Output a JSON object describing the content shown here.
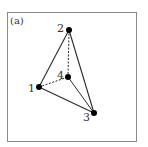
{
  "panel_label": "(a)",
  "colors": {
    "edge": "#2a2a2a",
    "frame": "#8a8a8a",
    "vertex": "#000000"
  },
  "vertices": [
    {
      "id": "1",
      "label": "1",
      "x": 39,
      "y": 87,
      "lx": 28,
      "ly": 92
    },
    {
      "id": "2",
      "label": "2",
      "x": 69,
      "y": 30,
      "lx": 57,
      "ly": 32
    },
    {
      "id": "3",
      "label": "3",
      "x": 94,
      "y": 113,
      "lx": 83,
      "ly": 121
    },
    {
      "id": "4",
      "label": "4",
      "x": 68,
      "y": 77,
      "lx": 57,
      "ly": 79
    }
  ],
  "edges": [
    {
      "from": "1",
      "to": "2",
      "style": "solid"
    },
    {
      "from": "2",
      "to": "3",
      "style": "solid"
    },
    {
      "from": "1",
      "to": "3",
      "style": "solid"
    },
    {
      "from": "2",
      "to": "4",
      "style": "dashed"
    },
    {
      "from": "1",
      "to": "4",
      "style": "dashed"
    },
    {
      "from": "4",
      "to": "3",
      "style": "solid"
    }
  ]
}
